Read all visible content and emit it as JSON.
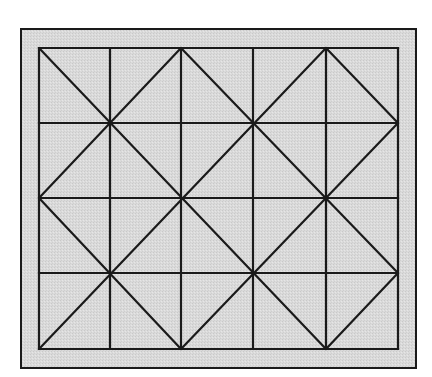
{
  "diagram": {
    "type": "grid-lattice",
    "colors": {
      "page_background": "#ffffff",
      "board_fill": "#d8d8d8",
      "line": "#1a1a1a"
    },
    "outer_frame": {
      "x": 21,
      "y": 29,
      "width": 395,
      "height": 339
    },
    "grid": {
      "columns": 5,
      "rows": 4,
      "x_lines": [
        39,
        110,
        181,
        253,
        326,
        398
      ],
      "y_lines": [
        48,
        123,
        198,
        273,
        349
      ]
    },
    "diagonals": [
      {
        "from": [
          0,
          0
        ],
        "to": [
          4,
          4
        ]
      },
      {
        "from": [
          2,
          0
        ],
        "to": [
          0,
          2
        ]
      },
      {
        "from": [
          2,
          0
        ],
        "to": [
          5,
          3
        ]
      },
      {
        "from": [
          4,
          0
        ],
        "to": [
          0,
          4
        ]
      },
      {
        "from": [
          4,
          0
        ],
        "to": [
          5,
          1
        ]
      },
      {
        "from": [
          5,
          1
        ],
        "to": [
          2,
          4
        ]
      },
      {
        "from": [
          0,
          2
        ],
        "to": [
          2,
          4
        ]
      },
      {
        "from": [
          5,
          3
        ],
        "to": [
          4,
          4
        ]
      }
    ]
  }
}
